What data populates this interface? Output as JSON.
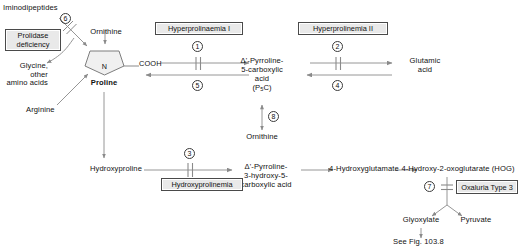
{
  "diagram": {
    "type": "biochemical-pathway",
    "line_color": "#8a8a8a",
    "box_fill": "#e9e9e9",
    "box_border": "#4a4a4a",
    "text_color": "#111111"
  },
  "metabolites": {
    "iminodipeptides": "Iminodipeptides",
    "ornithine_top": "Ornithine",
    "glycine_other": "Glycine,\nother\namino acids",
    "arginine": "Arginine",
    "proline": "Proline",
    "proline_n": "N",
    "proline_cooh": "COOH",
    "p5c_line1": "Δ'-Pyrroline-",
    "p5c_line2": "5-carboxylic",
    "p5c_line3": "acid",
    "p5c_line4_pre": "(P",
    "p5c_line4_sub": "5",
    "p5c_line4_post": "C)",
    "glutamic_acid": "Glutamic\nacid",
    "ornithine_mid": "Ornithine",
    "hydroxyproline": "Hydroxyproline",
    "hydroxy_p5c_line1": "Δ'-Pyrroline-",
    "hydroxy_p5c_line2": "3-hydroxy-5-",
    "hydroxy_p5c_line3": "carboxylic acid",
    "hydroxyglutamate": "4-Hydroxyglutamate",
    "hog": "4-Hydroxy-2-oxoglutarate (HOG)",
    "glyoxylate": "Glyoxylate",
    "pyruvate": "Pyruvate",
    "see_fig": "See Fig. 103.8"
  },
  "disorders": [
    {
      "id": "prolidase-deficiency",
      "label": "Prolidase\ndeficiency"
    },
    {
      "id": "hyperprolinaemia-1",
      "label": "Hyperprolinaemia I"
    },
    {
      "id": "hyperprolinemia-2",
      "label": "Hyperprolinemia II"
    },
    {
      "id": "hydroxyprolinemia",
      "label": "Hydroxyprolinemia"
    },
    {
      "id": "oxaluria-type-3",
      "label": "Oxaluria Type 3"
    }
  ],
  "enzyme_steps": [
    {
      "number": "1",
      "near": "proline-to-p5c"
    },
    {
      "number": "2",
      "near": "p5c-to-glutamic-acid"
    },
    {
      "number": "3",
      "near": "hydroxyproline-to-hydroxy-p5c"
    },
    {
      "number": "4",
      "near": "glutamic-acid-to-p5c"
    },
    {
      "number": "5",
      "near": "p5c-to-proline"
    },
    {
      "number": "6",
      "near": "iminodipeptides-to-proline"
    },
    {
      "number": "7",
      "near": "hog-to-glyoxylate-pyruvate"
    },
    {
      "number": "8",
      "near": "p5c-to-ornithine"
    }
  ]
}
